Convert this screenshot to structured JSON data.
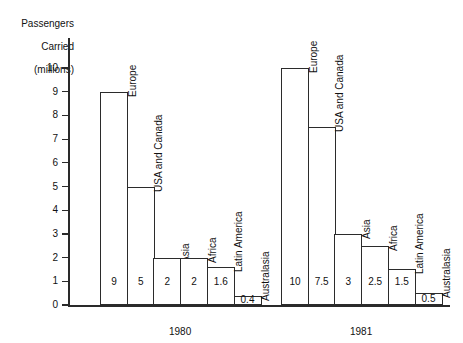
{
  "chart_data": {
    "type": "bar",
    "title": "",
    "ylabel": "Passengers\nCarried\n(millions)",
    "xlabel": "",
    "ylim": [
      0,
      10.5
    ],
    "grid": false,
    "legend": "none",
    "y_ticks": [
      "0",
      "1",
      "2",
      "3",
      "4",
      "5",
      "6",
      "7",
      "8",
      "9",
      "10"
    ],
    "categories": [
      "Europe",
      "USA and Canada",
      "Asia",
      "Africa",
      "Latin America",
      "Australasia"
    ],
    "groups": [
      "1980",
      "1981"
    ],
    "series": [
      {
        "name": "1980",
        "values": [
          9,
          5,
          2,
          2,
          1.6,
          0.4
        ],
        "labels": [
          "9",
          "5",
          "2",
          "2",
          "1.6",
          "0.4"
        ]
      },
      {
        "name": "1981",
        "values": [
          10,
          7.5,
          3,
          2.5,
          1.5,
          0.5
        ],
        "labels": [
          "10",
          "7.5",
          "3",
          "2.5",
          "1.5",
          "0.5"
        ]
      }
    ]
  },
  "axis": {
    "y_title_line1": "Passengers",
    "y_title_line2": "Carried",
    "y_title_line3": "(millions)"
  },
  "groups": [
    {
      "label": "1980",
      "bars": [
        {
          "name": "Europe",
          "value": "9"
        },
        {
          "name": "USA and Canada",
          "value": "5"
        },
        {
          "name": "Asia",
          "value": "2"
        },
        {
          "name": "Africa",
          "value": "2"
        },
        {
          "name": "Latin America",
          "value": "1.6"
        },
        {
          "name": "Australasia",
          "value": "0.4"
        }
      ]
    },
    {
      "label": "1981",
      "bars": [
        {
          "name": "Europe",
          "value": "10"
        },
        {
          "name": "USA and Canada",
          "value": "7.5"
        },
        {
          "name": "Asia",
          "value": "3"
        },
        {
          "name": "Africa",
          "value": "2.5"
        },
        {
          "name": "Latin America",
          "value": "1.5"
        },
        {
          "name": "Australasia",
          "value": "0.5"
        }
      ]
    }
  ],
  "ticks": [
    {
      "label": "10"
    },
    {
      "label": "9"
    },
    {
      "label": "8"
    },
    {
      "label": "7"
    },
    {
      "label": "6"
    },
    {
      "label": "5"
    },
    {
      "label": "4"
    },
    {
      "label": "3"
    },
    {
      "label": "2"
    },
    {
      "label": "1"
    },
    {
      "label": "0"
    }
  ]
}
